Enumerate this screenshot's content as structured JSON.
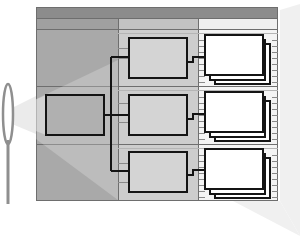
{
  "diagram": {
    "type": "hierarchy-tree-with-lens-projection",
    "text_labels": [],
    "colors": {
      "background": "#ffffff",
      "header_bar": "#8c8c8c",
      "subheader_left": "#a8a8a8",
      "subheader_middle": "#c4c4c4",
      "subheader_right": "#f2f2f2",
      "column_left": "#a9a9a9",
      "column_middle": "#cdcdcd",
      "column_right": "#f4f4f4",
      "node_left": "#b0b0b0",
      "node_middle": "#d4d4d4",
      "node_right": "#ffffff",
      "outline": "#1a1a1a",
      "grid_line": "#7a7a7a",
      "rung": "#9a9a9a",
      "beam": "#e8e8e8",
      "lens": "#9a9a9a"
    },
    "columns": [
      {
        "name": "level-1",
        "shade": "dark"
      },
      {
        "name": "level-2",
        "shade": "medium"
      },
      {
        "name": "level-3",
        "shade": "light"
      }
    ],
    "nodes": {
      "root_count": 1,
      "level2_count": 3,
      "level3_stack_count": 3,
      "pages_per_stack": 3
    },
    "lens": {
      "shape": "ellipse-with-stem",
      "position": "left"
    }
  }
}
